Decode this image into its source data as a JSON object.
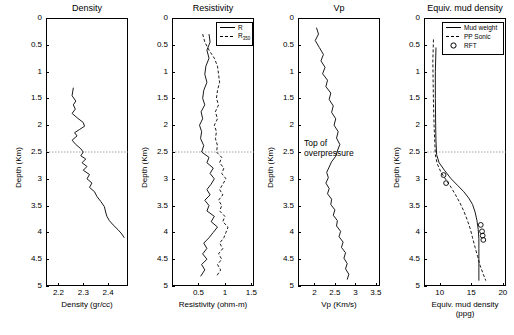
{
  "chart_data": [
    {
      "type": "line",
      "title": "Density",
      "xlabel": "Density (gr/cc)",
      "ylabel": "Depth (Km)",
      "xlim": [
        2.15,
        2.48
      ],
      "ylim": [
        0,
        5
      ],
      "xticks": [
        "2.2",
        "2.3",
        "2.4"
      ],
      "yticks": [
        "0",
        "0.5",
        "1",
        "1.5",
        "2",
        "2.5",
        "3",
        "3.5",
        "4",
        "4.5",
        "5"
      ],
      "grid": false,
      "series": [
        {
          "name": "Density",
          "points": [
            [
              2.26,
              1.3
            ],
            [
              2.255,
              1.45
            ],
            [
              2.27,
              1.55
            ],
            [
              2.26,
              1.62
            ],
            [
              2.268,
              1.7
            ],
            [
              2.255,
              1.78
            ],
            [
              2.275,
              1.86
            ],
            [
              2.3,
              1.95
            ],
            [
              2.305,
              2.02
            ],
            [
              2.285,
              2.08
            ],
            [
              2.265,
              2.14
            ],
            [
              2.275,
              2.2
            ],
            [
              2.255,
              2.28
            ],
            [
              2.27,
              2.36
            ],
            [
              2.29,
              2.44
            ],
            [
              2.3,
              2.5
            ],
            [
              2.29,
              2.57
            ],
            [
              2.31,
              2.63
            ],
            [
              2.295,
              2.7
            ],
            [
              2.315,
              2.77
            ],
            [
              2.3,
              2.84
            ],
            [
              2.325,
              2.92
            ],
            [
              2.315,
              3.0
            ],
            [
              2.335,
              3.08
            ],
            [
              2.325,
              3.16
            ],
            [
              2.345,
              3.24
            ],
            [
              2.355,
              3.33
            ],
            [
              2.37,
              3.42
            ],
            [
              2.385,
              3.52
            ],
            [
              2.39,
              3.62
            ],
            [
              2.395,
              3.7
            ],
            [
              2.405,
              3.78
            ],
            [
              2.42,
              3.86
            ],
            [
              2.44,
              3.95
            ],
            [
              2.455,
              4.03
            ],
            [
              2.465,
              4.1
            ]
          ]
        }
      ]
    },
    {
      "type": "line",
      "title": "Resistivity",
      "xlabel": "Resistivity (ohm-m)",
      "ylabel": "Depth (Km)",
      "xlim": [
        0.0,
        1.55
      ],
      "ylim": [
        0,
        5
      ],
      "xticks": [
        "0.5",
        "1",
        "1.5"
      ],
      "yticks": [
        "0",
        "0.5",
        "1",
        "1.5",
        "2",
        "2.5",
        "3",
        "3.5",
        "4",
        "4.5",
        "5"
      ],
      "grid": false,
      "legend": [
        "R",
        "R_{350}"
      ],
      "legend_position": "top-right",
      "series": [
        {
          "name": "R",
          "style": "solid",
          "points": [
            [
              0.7,
              0.3
            ],
            [
              0.72,
              0.45
            ],
            [
              0.66,
              0.6
            ],
            [
              0.7,
              0.75
            ],
            [
              0.64,
              0.9
            ],
            [
              0.62,
              1.05
            ],
            [
              0.66,
              1.2
            ],
            [
              0.6,
              1.35
            ],
            [
              0.58,
              1.5
            ],
            [
              0.62,
              1.62
            ],
            [
              0.55,
              1.75
            ],
            [
              0.58,
              1.88
            ],
            [
              0.52,
              2.0
            ],
            [
              0.56,
              2.12
            ],
            [
              0.54,
              2.25
            ],
            [
              0.6,
              2.38
            ],
            [
              0.56,
              2.5
            ],
            [
              0.7,
              2.6
            ],
            [
              0.66,
              2.7
            ],
            [
              0.78,
              2.8
            ],
            [
              0.72,
              2.9
            ],
            [
              0.8,
              3.0
            ],
            [
              0.74,
              3.1
            ],
            [
              0.66,
              3.2
            ],
            [
              0.72,
              3.3
            ],
            [
              0.62,
              3.4
            ],
            [
              0.7,
              3.5
            ],
            [
              0.66,
              3.6
            ],
            [
              0.8,
              3.7
            ],
            [
              0.74,
              3.8
            ],
            [
              0.86,
              3.9
            ],
            [
              0.78,
              4.0
            ],
            [
              0.7,
              4.1
            ],
            [
              0.6,
              4.2
            ],
            [
              0.66,
              4.3
            ],
            [
              0.58,
              4.4
            ],
            [
              0.66,
              4.5
            ],
            [
              0.56,
              4.6
            ],
            [
              0.62,
              4.7
            ],
            [
              0.54,
              4.82
            ]
          ]
        },
        {
          "name": "R_{350}",
          "style": "dashed",
          "points": [
            [
              0.58,
              0.3
            ],
            [
              0.62,
              0.45
            ],
            [
              0.7,
              0.6
            ],
            [
              0.8,
              0.75
            ],
            [
              0.86,
              0.9
            ],
            [
              0.88,
              1.05
            ],
            [
              0.9,
              1.2
            ],
            [
              0.86,
              1.35
            ],
            [
              0.84,
              1.5
            ],
            [
              0.88,
              1.62
            ],
            [
              0.82,
              1.75
            ],
            [
              0.86,
              1.88
            ],
            [
              0.8,
              2.0
            ],
            [
              0.84,
              2.12
            ],
            [
              0.82,
              2.25
            ],
            [
              0.86,
              2.38
            ],
            [
              0.84,
              2.5
            ],
            [
              0.94,
              2.6
            ],
            [
              0.9,
              2.7
            ],
            [
              0.98,
              2.8
            ],
            [
              0.94,
              2.9
            ],
            [
              1.02,
              3.0
            ],
            [
              0.96,
              3.1
            ],
            [
              0.9,
              3.2
            ],
            [
              0.96,
              3.3
            ],
            [
              0.88,
              3.4
            ],
            [
              0.94,
              3.5
            ],
            [
              0.9,
              3.6
            ],
            [
              1.0,
              3.7
            ],
            [
              0.96,
              3.8
            ],
            [
              1.06,
              3.9
            ],
            [
              1.02,
              4.0
            ],
            [
              0.98,
              4.1
            ],
            [
              0.9,
              4.2
            ],
            [
              0.96,
              4.3
            ],
            [
              0.88,
              4.4
            ],
            [
              0.94,
              4.5
            ],
            [
              0.86,
              4.6
            ],
            [
              0.92,
              4.7
            ],
            [
              0.84,
              4.82
            ]
          ]
        }
      ]
    },
    {
      "type": "line",
      "title": "Vp",
      "xlabel": "Vp (Km/s)",
      "ylabel": "Depth (Km)",
      "xlim": [
        1.6,
        3.6
      ],
      "ylim": [
        0,
        5
      ],
      "xticks": [
        "2",
        "2.5",
        "3",
        "3.5"
      ],
      "yticks": [
        "0",
        "0.5",
        "1",
        "1.5",
        "2",
        "2.5",
        "3",
        "3.5",
        "4",
        "4.5",
        "5"
      ],
      "grid": false,
      "annotation": "Top of\noverpressure",
      "series": [
        {
          "name": "Vp",
          "points": [
            [
              2.05,
              0.18
            ],
            [
              2.1,
              0.3
            ],
            [
              2.02,
              0.42
            ],
            [
              2.12,
              0.55
            ],
            [
              2.22,
              0.68
            ],
            [
              2.16,
              0.8
            ],
            [
              2.26,
              0.92
            ],
            [
              2.2,
              1.04
            ],
            [
              2.32,
              1.16
            ],
            [
              2.28,
              1.28
            ],
            [
              2.4,
              1.4
            ],
            [
              2.36,
              1.52
            ],
            [
              2.46,
              1.64
            ],
            [
              2.42,
              1.76
            ],
            [
              2.52,
              1.88
            ],
            [
              2.48,
              2.0
            ],
            [
              2.58,
              2.12
            ],
            [
              2.54,
              2.24
            ],
            [
              2.62,
              2.36
            ],
            [
              2.56,
              2.48
            ],
            [
              2.52,
              2.58
            ],
            [
              2.42,
              2.68
            ],
            [
              2.36,
              2.78
            ],
            [
              2.3,
              2.88
            ],
            [
              2.34,
              2.98
            ],
            [
              2.28,
              3.08
            ],
            [
              2.36,
              3.18
            ],
            [
              2.32,
              3.28
            ],
            [
              2.42,
              3.38
            ],
            [
              2.4,
              3.48
            ],
            [
              2.5,
              3.58
            ],
            [
              2.46,
              3.68
            ],
            [
              2.56,
              3.78
            ],
            [
              2.54,
              3.88
            ],
            [
              2.64,
              3.98
            ],
            [
              2.6,
              4.08
            ],
            [
              2.7,
              4.18
            ],
            [
              2.66,
              4.28
            ],
            [
              2.76,
              4.38
            ],
            [
              2.72,
              4.48
            ],
            [
              2.8,
              4.58
            ],
            [
              2.76,
              4.68
            ],
            [
              2.84,
              4.78
            ],
            [
              2.8,
              4.88
            ]
          ]
        }
      ]
    },
    {
      "type": "line",
      "title": "Equiv. mud density",
      "xlabel": "Equiv. mud density (ppg)",
      "ylabel": "Depth (Km)",
      "xlim": [
        7.5,
        20.5
      ],
      "ylim": [
        0,
        5
      ],
      "xticks": [
        "10",
        "15",
        "20"
      ],
      "yticks": [
        "0",
        "0.5",
        "1",
        "1.5",
        "2",
        "2.5",
        "3",
        "3.5",
        "4",
        "4.5",
        "5"
      ],
      "grid": false,
      "legend": [
        "Mud weight",
        "PP Sonic",
        "RFT"
      ],
      "legend_position": "top-right",
      "series": [
        {
          "name": "Mud weight",
          "style": "solid",
          "points": [
            [
              9.4,
              0.55
            ],
            [
              9.3,
              1.0
            ],
            [
              9.3,
              1.5
            ],
            [
              9.35,
              2.0
            ],
            [
              9.4,
              2.3
            ],
            [
              9.5,
              2.55
            ],
            [
              9.9,
              2.7
            ],
            [
              10.8,
              2.85
            ],
            [
              11.8,
              3.0
            ],
            [
              12.8,
              3.12
            ],
            [
              13.8,
              3.24
            ],
            [
              14.6,
              3.36
            ],
            [
              15.2,
              3.48
            ],
            [
              15.6,
              3.62
            ],
            [
              15.9,
              3.78
            ],
            [
              16.1,
              3.95
            ],
            [
              16.2,
              4.12
            ],
            [
              16.2,
              4.3
            ],
            [
              16.2,
              4.5
            ],
            [
              16.2,
              4.7
            ],
            [
              16.2,
              4.9
            ]
          ]
        },
        {
          "name": "PP Sonic",
          "style": "dashed",
          "points": [
            [
              9.0,
              0.4
            ],
            [
              8.9,
              0.8
            ],
            [
              8.95,
              1.2
            ],
            [
              9.0,
              1.6
            ],
            [
              9.1,
              2.0
            ],
            [
              9.2,
              2.3
            ],
            [
              9.3,
              2.55
            ],
            [
              9.6,
              2.72
            ],
            [
              10.2,
              2.88
            ],
            [
              11.0,
              3.02
            ],
            [
              11.8,
              3.16
            ],
            [
              12.5,
              3.3
            ],
            [
              13.2,
              3.45
            ],
            [
              13.8,
              3.6
            ],
            [
              14.3,
              3.75
            ],
            [
              14.8,
              3.92
            ],
            [
              15.2,
              4.1
            ],
            [
              15.6,
              4.28
            ],
            [
              16.0,
              4.45
            ],
            [
              16.4,
              4.62
            ],
            [
              16.9,
              4.78
            ],
            [
              17.3,
              4.9
            ]
          ]
        },
        {
          "name": "RFT",
          "style": "marker",
          "points": [
            [
              10.6,
              2.93
            ],
            [
              11.0,
              3.08
            ],
            [
              16.5,
              3.86
            ],
            [
              16.7,
              3.98
            ],
            [
              16.8,
              4.06
            ],
            [
              16.9,
              4.14
            ]
          ]
        }
      ]
    }
  ]
}
